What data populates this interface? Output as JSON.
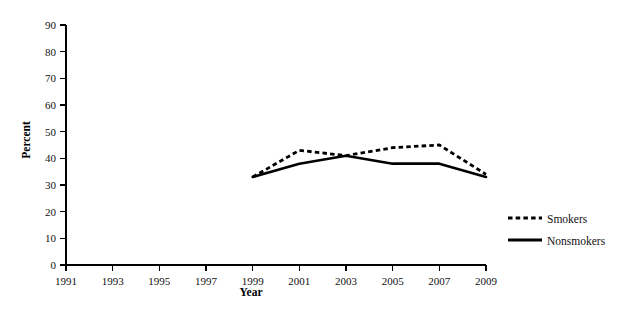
{
  "chart_data": {
    "type": "line",
    "title": "",
    "xlabel": "Year",
    "ylabel": "Percent",
    "x": [
      1999,
      2001,
      2003,
      2005,
      2007,
      2009
    ],
    "xlim": [
      1991,
      2009
    ],
    "ylim": [
      0,
      90
    ],
    "xticks": [
      1991,
      1993,
      1995,
      1997,
      1999,
      2001,
      2003,
      2005,
      2007,
      2009
    ],
    "xtick_labels": [
      "1991",
      "1993",
      "1995",
      "1997",
      "1999",
      "2001",
      "2003",
      "2005",
      "2007",
      "2009"
    ],
    "yticks": [
      0,
      10,
      20,
      30,
      40,
      50,
      60,
      70,
      80,
      90
    ],
    "ytick_labels": [
      "0",
      "10",
      "20",
      "30",
      "40",
      "50",
      "60",
      "70",
      "80",
      "90"
    ],
    "grid": false,
    "legend_position": "right",
    "series": [
      {
        "name": "Smokers",
        "style": "dashed",
        "color": "#000000",
        "values": [
          33,
          43,
          41,
          44,
          45,
          34
        ]
      },
      {
        "name": "Nonsmokers",
        "style": "solid",
        "color": "#000000",
        "values": [
          33,
          38,
          41,
          38,
          38,
          33
        ]
      }
    ]
  },
  "legend": {
    "entries": [
      {
        "label": "Smokers",
        "style": "dashed"
      },
      {
        "label": "Nonsmokers",
        "style": "solid"
      }
    ]
  },
  "axes": {
    "y_title": "Percent",
    "x_title": "Year"
  }
}
